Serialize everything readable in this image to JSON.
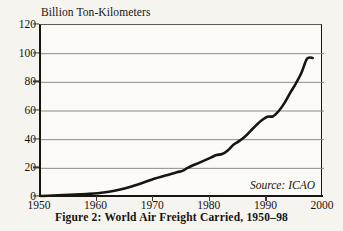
{
  "figure": {
    "caption": "Figure 2: World Air Freight Carried, 1950–98",
    "source_note": "Source: ICAO",
    "background_color": "#f6f4ef",
    "line_color": "#17150f",
    "grid_color": "#8d8a82"
  },
  "chart_data": {
    "type": "line",
    "title": "Figure 2: World Air Freight Carried, 1950–98",
    "xlabel": "",
    "ylabel": "Billion Ton-Kilometers",
    "xlim": [
      1950,
      2000
    ],
    "ylim": [
      0,
      120
    ],
    "xticks": [
      1950,
      1960,
      1970,
      1980,
      1990,
      2000
    ],
    "yticks": [
      0,
      20,
      40,
      60,
      80,
      100,
      120
    ],
    "xtick_labels": [
      "1950",
      "1960",
      "1970",
      "1980",
      "1990",
      "2000"
    ],
    "ytick_labels": [
      "0",
      "20",
      "40",
      "60",
      "80",
      "100",
      "120"
    ],
    "grid": true,
    "grid_axis": "y",
    "legend": false,
    "annotations": [
      "Source: ICAO"
    ],
    "series": [
      {
        "name": "World air freight carried",
        "units": "Billion Ton-Kilometers",
        "x": [
          1950,
          1952,
          1954,
          1956,
          1958,
          1960,
          1962,
          1964,
          1966,
          1968,
          1970,
          1972,
          1974,
          1975,
          1976,
          1978,
          1980,
          1981,
          1982,
          1983,
          1984,
          1985,
          1986,
          1987,
          1988,
          1989,
          1990,
          1991,
          1992,
          1993,
          1994,
          1995,
          1996,
          1997,
          1998
        ],
        "values": [
          0.7,
          1.0,
          1.3,
          1.7,
          2.1,
          2.6,
          3.6,
          5.2,
          7.4,
          10.0,
          12.8,
          15.0,
          17.3,
          18.2,
          20.5,
          24.0,
          27.5,
          29.3,
          30.0,
          32.5,
          36.5,
          39.0,
          42.0,
          46.0,
          50.0,
          53.5,
          56.0,
          56.3,
          60.0,
          65.5,
          72.5,
          79.0,
          86.5,
          96.5,
          97.0
        ]
      }
    ]
  },
  "axes": {
    "y_title": "Billion Ton-Kilometers"
  }
}
